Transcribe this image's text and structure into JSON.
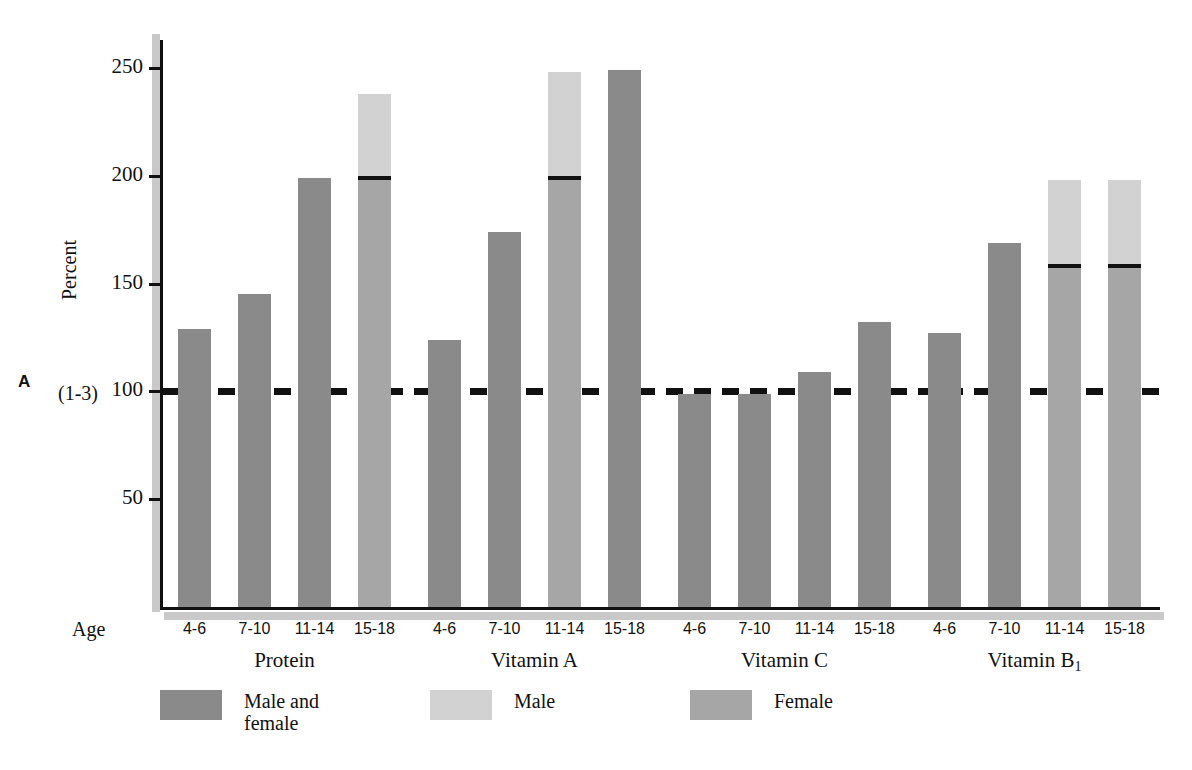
{
  "panel": {
    "letter": "A"
  },
  "axes": {
    "y_title": "Percent",
    "y_ref_annotation": "(1-3)",
    "x_title": "Age"
  },
  "legend": {
    "items": [
      {
        "label": "Male and\nfemale",
        "color": "#8a8a8a",
        "key": "both"
      },
      {
        "label": "Male",
        "color": "#d2d2d2",
        "key": "male"
      },
      {
        "label": "Female",
        "color": "#a6a6a6",
        "key": "female"
      }
    ]
  },
  "chart_data": {
    "type": "bar",
    "title": "",
    "xlabel": "Age",
    "ylabel": "Percent",
    "ylim": [
      0,
      265
    ],
    "yticks": [
      50,
      100,
      150,
      200,
      250
    ],
    "grid": false,
    "legend_position": "bottom",
    "reference_line": {
      "value": 100,
      "style": "dashed",
      "label": "(1-3)"
    },
    "groups": [
      "Protein",
      "Vitamin A",
      "Vitamin C",
      "Vitamin B₁"
    ],
    "categories": [
      "4-6",
      "7-10",
      "11-14",
      "15-18"
    ],
    "bars": [
      {
        "group": "Protein",
        "age": "4-6",
        "series": "Male and female",
        "value": 129
      },
      {
        "group": "Protein",
        "age": "7-10",
        "series": "Male and female",
        "value": 145
      },
      {
        "group": "Protein",
        "age": "11-14",
        "series": "Male and female",
        "value": 199
      },
      {
        "group": "Protein",
        "age": "15-18",
        "series": "Male/Female split",
        "male": 238,
        "female": 199
      },
      {
        "group": "Vitamin A",
        "age": "4-6",
        "series": "Male and female",
        "value": 124
      },
      {
        "group": "Vitamin A",
        "age": "7-10",
        "series": "Male and female",
        "value": 174
      },
      {
        "group": "Vitamin A",
        "age": "11-14",
        "series": "Male/Female split",
        "male": 248,
        "female": 199
      },
      {
        "group": "Vitamin A",
        "age": "15-18",
        "series": "Male and female",
        "value": 249
      },
      {
        "group": "Vitamin C",
        "age": "4-6",
        "series": "Male and female",
        "value": 99
      },
      {
        "group": "Vitamin C",
        "age": "7-10",
        "series": "Male and female",
        "value": 99
      },
      {
        "group": "Vitamin C",
        "age": "11-14",
        "series": "Male and female",
        "value": 109
      },
      {
        "group": "Vitamin C",
        "age": "15-18",
        "series": "Male and female",
        "value": 132
      },
      {
        "group": "Vitamin B₁",
        "age": "4-6",
        "series": "Male and female",
        "value": 127
      },
      {
        "group": "Vitamin B₁",
        "age": "7-10",
        "series": "Male and female",
        "value": 169
      },
      {
        "group": "Vitamin B₁",
        "age": "11-14",
        "series": "Male/Female split",
        "male": 198,
        "female": 158
      },
      {
        "group": "Vitamin B₁",
        "age": "15-18",
        "series": "Male/Female split",
        "male": 198,
        "female": 158
      }
    ]
  },
  "colors": {
    "both": "#8a8a8a",
    "male": "#d2d2d2",
    "female": "#a6a6a6",
    "axis": "#111111",
    "shadow": "#c9c9c9"
  }
}
